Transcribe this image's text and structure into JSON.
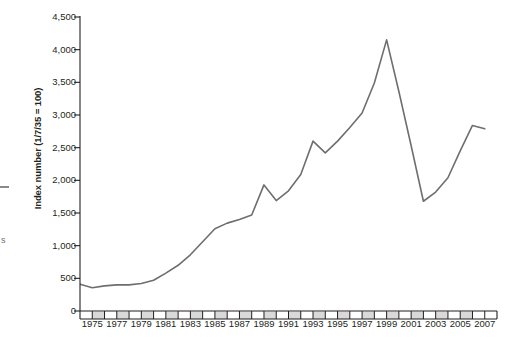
{
  "chart_data": {
    "type": "line",
    "title": "",
    "subtitle": "",
    "xlabel": "",
    "ylabel": "Index number (1/7/35 = 100)",
    "ylim": [
      0,
      4500
    ],
    "ytick_values": [
      0,
      500,
      1000,
      1500,
      2000,
      2500,
      3000,
      3500,
      4000,
      4500
    ],
    "ytick_labels": [
      "0",
      "500",
      "1,000",
      "1,500",
      "2,000",
      "2,500",
      "3,000",
      "3,500",
      "4,000",
      "4,500"
    ],
    "xlim": [
      1974,
      2008
    ],
    "xtick_values": [
      1975,
      1976,
      1977,
      1978,
      1979,
      1980,
      1981,
      1982,
      1983,
      1984,
      1985,
      1986,
      1987,
      1988,
      1989,
      1990,
      1991,
      1992,
      1993,
      1994,
      1995,
      1996,
      1997,
      1998,
      1999,
      2000,
      2001,
      2002,
      2003,
      2004,
      2005,
      2006,
      2007
    ],
    "xtick_labels": [
      "1975",
      "1977",
      "1979",
      "1981",
      "1983",
      "1985",
      "1987",
      "1989",
      "1991",
      "1993",
      "1995",
      "1997",
      "1999",
      "2001",
      "2003",
      "2005",
      "2007"
    ],
    "xtick_labelled_values": [
      1975,
      1977,
      1979,
      1981,
      1983,
      1985,
      1987,
      1989,
      1991,
      1993,
      1995,
      1997,
      1999,
      2001,
      2003,
      2005,
      2007
    ],
    "grid": false,
    "legend": false,
    "legend_position": "none",
    "line_color": "#6d6e71",
    "line_width": 1.6,
    "axis_color": "#231f20",
    "axis_band_color": "#d9d9d9",
    "x": [
      1974,
      1975,
      1976,
      1977,
      1978,
      1979,
      1980,
      1981,
      1982,
      1983,
      1984,
      1985,
      1986,
      1987,
      1988,
      1989,
      1990,
      1991,
      1992,
      1993,
      1994,
      1995,
      1996,
      1997,
      1998,
      1999,
      2000,
      2001,
      2002,
      2003,
      2004,
      2005,
      2006,
      2007
    ],
    "values": [
      410,
      355,
      385,
      400,
      400,
      420,
      470,
      580,
      700,
      860,
      1060,
      1260,
      1345,
      1400,
      1470,
      1930,
      1690,
      1840,
      2090,
      2600,
      2420,
      2600,
      2810,
      3030,
      3490,
      4150,
      3360,
      2530,
      1680,
      1820,
      2040,
      2450,
      2840,
      2790
    ],
    "annotations": []
  },
  "edge_fragments": {
    "letter": "s"
  }
}
